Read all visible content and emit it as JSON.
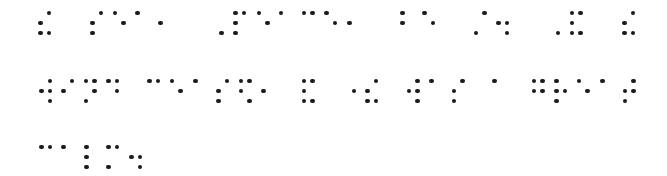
{
  "document": {
    "type": "braille",
    "grade": "contracted (UEB Grade 2)",
    "text_lines": [
      "the sea, Peace, be still. And the",
      "wind ceased, and there was a great",
      "calm."
    ],
    "full_text": "the sea, Peace, be still. And the wind ceased, and there was a great calm.",
    "dot_color": "#1b1b1b",
    "background": "#ffffff"
  },
  "layout": {
    "dot_dx": 8.5,
    "dot_dy": 10,
    "line_tops": [
      13,
      81,
      147
    ]
  },
  "lines": [
    {
      "words": [
        {
          "text": "the",
          "cells": [
            {
              "x": 40.7,
              "dots": [
                2,
                3,
                4,
                6
              ],
              "meaning": "the"
            }
          ]
        },
        {
          "text": "sea,",
          "cells": [
            {
              "x": 92.3,
              "dots": [
                2,
                3,
                4
              ],
              "meaning": "s"
            },
            {
              "x": 115.0,
              "dots": [
                1,
                5
              ],
              "meaning": "e"
            },
            {
              "x": 137.7,
              "dots": [
                1
              ],
              "meaning": "a"
            },
            {
              "x": 160.4,
              "dots": [
                2
              ],
              "meaning": ","
            }
          ]
        },
        {
          "text": "Peace,",
          "cells": [
            {
              "x": 213.0,
              "dots": [
                6
              ],
              "meaning": "capital"
            },
            {
              "x": 235.7,
              "dots": [
                1,
                2,
                3,
                4
              ],
              "meaning": "p"
            },
            {
              "x": 259.0,
              "dots": [
                1,
                5
              ],
              "meaning": "e"
            },
            {
              "x": 281.0,
              "dots": [
                1
              ],
              "meaning": "a"
            },
            {
              "x": 304.0,
              "dots": [
                1,
                4
              ],
              "meaning": "c"
            },
            {
              "x": 326.7,
              "dots": [
                1,
                5
              ],
              "meaning": "e"
            },
            {
              "x": 349.4,
              "dots": [
                2
              ],
              "meaning": ","
            }
          ]
        },
        {
          "text": "be",
          "cells": [
            {
              "x": 402.3,
              "dots": [
                1,
                2
              ],
              "meaning": "b"
            },
            {
              "x": 424.7,
              "dots": [
                1,
                5
              ],
              "meaning": "e"
            }
          ]
        },
        {
          "text": "still.",
          "cells": [
            {
              "x": 476.0,
              "dots": [
                3,
                4
              ],
              "meaning": "still"
            },
            {
              "x": 498.7,
              "dots": [
                2,
                5,
                6
              ],
              "meaning": "."
            }
          ]
        },
        {
          "text": "And",
          "cells": [
            {
              "x": 549.4,
              "dots": [
                6
              ],
              "meaning": "capital"
            },
            {
              "x": 572.0,
              "dots": [
                1,
                2,
                3,
                4,
                6
              ],
              "meaning": "and"
            }
          ]
        },
        {
          "text": "the",
          "cells": [
            {
              "x": 624.7,
              "dots": [
                2,
                3,
                4,
                6
              ],
              "meaning": "the"
            }
          ]
        }
      ]
    },
    {
      "words": [
        {
          "text": "wind",
          "cells": [
            {
              "x": 41.3,
              "dots": [
                2,
                4,
                5,
                6
              ],
              "meaning": "w"
            },
            {
              "x": 63.3,
              "dots": [
                2,
                4
              ],
              "meaning": "i"
            },
            {
              "x": 86.0,
              "dots": [
                1,
                3,
                4,
                5
              ],
              "meaning": "n"
            },
            {
              "x": 108.7,
              "dots": [
                1,
                4,
                5
              ],
              "meaning": "d"
            }
          ]
        },
        {
          "text": "ceased,",
          "cells": [
            {
              "x": 149.3,
              "dots": [
                1,
                4
              ],
              "meaning": "c"
            },
            {
              "x": 172.0,
              "dots": [
                1,
                5
              ],
              "meaning": "e"
            },
            {
              "x": 195.3,
              "dots": [
                1
              ],
              "meaning": "a"
            },
            {
              "x": 218.3,
              "dots": [
                2,
                3,
                4
              ],
              "meaning": "s"
            },
            {
              "x": 241.0,
              "dots": [
                1,
                2,
                4,
                6
              ],
              "meaning": "ed"
            },
            {
              "x": 263.3,
              "dots": [
                2
              ],
              "meaning": ","
            }
          ]
        },
        {
          "text": "and",
          "cells": [
            {
              "x": 304.0,
              "dots": [
                1,
                2,
                3,
                4,
                6
              ],
              "meaning": "and"
            }
          ]
        },
        {
          "text": "there",
          "cells": [
            {
              "x": 345.3,
              "dots": [
                5
              ],
              "meaning": "dot-5 prefix"
            },
            {
              "x": 367.7,
              "dots": [
                2,
                3,
                4,
                6
              ],
              "meaning": "the"
            }
          ]
        },
        {
          "text": "was",
          "cells": [
            {
              "x": 409.0,
              "dots": [
                2,
                4,
                5,
                6
              ],
              "meaning": "w"
            },
            {
              "x": 431.7,
              "dots": [
                1
              ],
              "meaning": "a"
            },
            {
              "x": 454.0,
              "dots": [
                2,
                3,
                4
              ],
              "meaning": "s"
            }
          ]
        },
        {
          "text": "a",
          "cells": [
            {
              "x": 494.3,
              "dots": [
                1
              ],
              "meaning": "a"
            }
          ]
        },
        {
          "text": "great",
          "cells": [
            {
              "x": 534.0,
              "dots": [
                1,
                2,
                4,
                5
              ],
              "meaning": "g"
            },
            {
              "x": 556.7,
              "dots": [
                1,
                2,
                3,
                5
              ],
              "meaning": "r"
            },
            {
              "x": 579.0,
              "dots": [
                1,
                5
              ],
              "meaning": "e"
            },
            {
              "x": 602.3,
              "dots": [
                1
              ],
              "meaning": "a"
            },
            {
              "x": 625.0,
              "dots": [
                2,
                3,
                4,
                5
              ],
              "meaning": "t"
            }
          ]
        }
      ]
    },
    {
      "words": [
        {
          "text": "calm.",
          "cells": [
            {
              "x": 41.3,
              "dots": [
                1,
                4
              ],
              "meaning": "c"
            },
            {
              "x": 63.3,
              "dots": [
                1
              ],
              "meaning": "a"
            },
            {
              "x": 86.7,
              "dots": [
                1,
                2,
                3
              ],
              "meaning": "l"
            },
            {
              "x": 108.7,
              "dots": [
                1,
                3,
                4
              ],
              "meaning": "m"
            },
            {
              "x": 131.3,
              "dots": [
                2,
                5,
                6
              ],
              "meaning": "."
            }
          ]
        }
      ]
    }
  ]
}
